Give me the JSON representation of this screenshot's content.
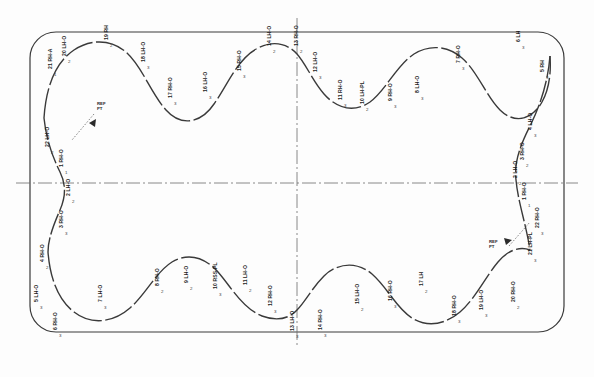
{
  "sheet": {
    "title": "Closed-Loop Station Layout",
    "background": "#fdfdfd",
    "line_color": "#3a3a3a",
    "centerline_color": "#555555",
    "label_color": "#1c1c1c"
  },
  "frame": {
    "name": "outer-boundary",
    "shape": "rounded-rectangle",
    "x": 30,
    "y": 32,
    "width": 534,
    "height": 300,
    "corner_radius": 26
  },
  "centerlines": {
    "horizontal": {
      "label": "horizontal-centerline",
      "y": 183
    },
    "vertical": {
      "label": "vertical-centerline",
      "x": 297
    }
  },
  "stations": [
    {
      "id": 1,
      "label": "1 RH-O",
      "x": 59,
      "y": 167,
      "orient": "rot",
      "tick": "1"
    },
    {
      "id": 2,
      "label": "2 LH-O",
      "x": 66,
      "y": 196,
      "orient": "rot",
      "tick": "2"
    },
    {
      "id": 3,
      "label": "3 RH-O",
      "x": 59,
      "y": 228,
      "orient": "rot",
      "tick": "3"
    },
    {
      "id": 4,
      "label": "4 RH-O",
      "x": 40,
      "y": 262,
      "orient": "rot",
      "tick": "2"
    },
    {
      "id": 5,
      "label": "5 LH-O",
      "x": 34,
      "y": 302,
      "orient": "rot",
      "tick": "3"
    },
    {
      "id": 6,
      "label": "6 RH-O",
      "x": 53,
      "y": 330,
      "orient": "rot",
      "tick": "3"
    },
    {
      "id": 7,
      "label": "7 LH-O",
      "x": 98,
      "y": 302,
      "orient": "rot",
      "tick": "3"
    },
    {
      "id": 8,
      "label": "8 RH-O",
      "x": 155,
      "y": 286,
      "orient": "rot",
      "tick": "2"
    },
    {
      "id": 9,
      "label": "9 LH-O",
      "x": 184,
      "y": 283,
      "orient": "rot",
      "tick": "2"
    },
    {
      "id": 10,
      "label": "10 RSS-PL",
      "x": 213,
      "y": 289,
      "orient": "rot",
      "tick": "3"
    },
    {
      "id": 11,
      "label": "11 LH-O",
      "x": 243,
      "y": 285,
      "orient": "rot",
      "tick": "2"
    },
    {
      "id": 12,
      "label": "12 RH-O",
      "x": 268,
      "y": 306,
      "orient": "rot",
      "tick": "3"
    },
    {
      "id": 13,
      "label": "13 LH-O",
      "x": 290,
      "y": 331,
      "orient": "rot",
      "tick": "3"
    },
    {
      "id": 14,
      "label": "14 RH-O",
      "x": 318,
      "y": 330,
      "orient": "rot",
      "tick": "3"
    },
    {
      "id": 15,
      "label": "15 LH-O",
      "x": 355,
      "y": 304,
      "orient": "rot",
      "tick": "2"
    },
    {
      "id": 16,
      "label": "16 RH-O",
      "x": 388,
      "y": 301,
      "orient": "rot",
      "tick": "3"
    },
    {
      "id": 17,
      "label": "17 LH",
      "x": 419,
      "y": 286,
      "orient": "rot",
      "tick": "2"
    },
    {
      "id": 18,
      "label": "18 RH-O",
      "x": 452,
      "y": 316,
      "orient": "rot",
      "tick": "3"
    },
    {
      "id": 19,
      "label": "19 LH-O",
      "x": 479,
      "y": 310,
      "orient": "rot",
      "tick": "3"
    },
    {
      "id": 20,
      "label": "20 RH-O",
      "x": 511,
      "y": 302,
      "orient": "rot",
      "tick": "2"
    },
    {
      "id": 21,
      "label": "21 LH-PL",
      "x": 528,
      "y": 255,
      "orient": "rot",
      "tick": "3"
    },
    {
      "id": 22,
      "label": "22 RH-O",
      "x": 535,
      "y": 228,
      "orient": "rot",
      "tick": "3"
    },
    {
      "id": 23,
      "label": "1 RH-O",
      "x": 522,
      "y": 200,
      "orient": "rot",
      "tick": "1"
    },
    {
      "id": 24,
      "label": "2 LH-O",
      "x": 513,
      "y": 178,
      "orient": "rot",
      "tick": "2"
    },
    {
      "id": 25,
      "label": "3 RH-O",
      "x": 520,
      "y": 160,
      "orient": "rot",
      "tick": "2"
    },
    {
      "id": 26,
      "label": "4 LH-O",
      "x": 528,
      "y": 130,
      "orient": "rot",
      "tick": "3"
    },
    {
      "id": 27,
      "label": "5 RH",
      "x": 540,
      "y": 72,
      "orient": "rot",
      "tick": "3"
    },
    {
      "id": 28,
      "label": "6 LH",
      "x": 516,
      "y": 42,
      "orient": "rot",
      "tick": "3"
    },
    {
      "id": 29,
      "label": "7 RH-O",
      "x": 456,
      "y": 63,
      "orient": "rot",
      "tick": "3"
    },
    {
      "id": 30,
      "label": "8 LH-O",
      "x": 415,
      "y": 93,
      "orient": "rot",
      "tick": "3"
    },
    {
      "id": 31,
      "label": "9 RH-O",
      "x": 388,
      "y": 101,
      "orient": "rot",
      "tick": "3"
    },
    {
      "id": 32,
      "label": "10 LH-PL",
      "x": 360,
      "y": 104,
      "orient": "rot",
      "tick": "2"
    },
    {
      "id": 33,
      "label": "11 RH-O",
      "x": 338,
      "y": 100,
      "orient": "rot",
      "tick": "3"
    },
    {
      "id": 34,
      "label": "12 LH-O",
      "x": 313,
      "y": 72,
      "orient": "rot",
      "tick": "3"
    },
    {
      "id": 35,
      "label": "13 RH-O",
      "x": 294,
      "y": 46,
      "orient": "rot",
      "tick": "2"
    },
    {
      "id": 36,
      "label": "14 LH-O",
      "x": 267,
      "y": 46,
      "orient": "rot",
      "tick": "2"
    },
    {
      "id": 37,
      "label": "15 RH-O",
      "x": 237,
      "y": 71,
      "orient": "rot",
      "tick": "3"
    },
    {
      "id": 38,
      "label": "16 LH-O",
      "x": 203,
      "y": 92,
      "orient": "rot",
      "tick": "3"
    },
    {
      "id": 39,
      "label": "17 RH-O",
      "x": 168,
      "y": 98,
      "orient": "rot",
      "tick": "3"
    },
    {
      "id": 40,
      "label": "18 LH-O",
      "x": 141,
      "y": 62,
      "orient": "rot",
      "tick": "3"
    },
    {
      "id": 41,
      "label": "19 RH",
      "x": 104,
      "y": 40,
      "orient": "rot",
      "tick": "2"
    },
    {
      "id": 42,
      "label": "20 LH-O",
      "x": 62,
      "y": 56,
      "orient": "rot",
      "tick": "2"
    },
    {
      "id": 43,
      "label": "21 RH-A",
      "x": 48,
      "y": 69,
      "orient": "rot",
      "tick": "1"
    },
    {
      "id": 44,
      "label": "22 LH-O",
      "x": 45,
      "y": 147,
      "orient": "rot",
      "tick": "2"
    }
  ],
  "callouts": [
    {
      "name": "left-callout",
      "text": "REF\nPT",
      "text_x": 97,
      "text_y": 102,
      "leader": {
        "x1": 94,
        "y1": 114,
        "x2": 72,
        "y2": 140
      },
      "marker_x": 93,
      "marker_y": 122
    },
    {
      "name": "right-callout",
      "text": "REF\nPT",
      "text_x": 489,
      "text_y": 240,
      "leader": {
        "x1": 509,
        "y1": 246,
        "x2": 530,
        "y2": 222
      },
      "marker_x": 508,
      "marker_y": 240
    }
  ],
  "legend": {
    "orientation_codes": [
      "LH",
      "RH",
      "O",
      "PL",
      "A",
      "RSS-PL"
    ]
  }
}
